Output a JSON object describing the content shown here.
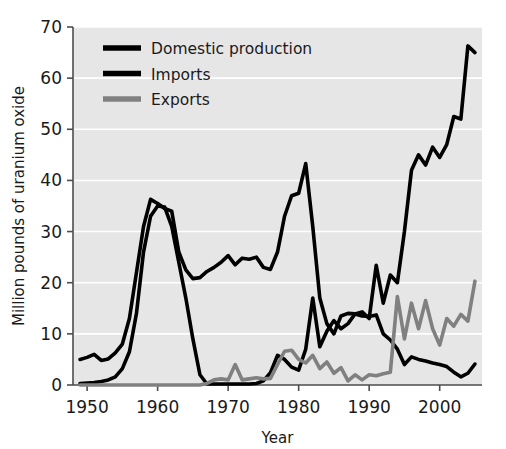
{
  "chart_data": {
    "type": "line",
    "title": "",
    "xlabel": "Year",
    "ylabel": "Million pounds of uranium oxide",
    "xlim": [
      1948,
      2006
    ],
    "ylim": [
      0,
      70
    ],
    "yticks": [
      0,
      10,
      20,
      30,
      40,
      50,
      60,
      70
    ],
    "xticks": [
      1950,
      1960,
      1970,
      1980,
      1990,
      2000
    ],
    "grid": "horizontal-white-gridlines",
    "legend_position": "top-left-inside",
    "plot_background": "#e6e6e6",
    "x": [
      1949,
      1950,
      1951,
      1952,
      1953,
      1954,
      1955,
      1956,
      1957,
      1958,
      1959,
      1960,
      1961,
      1962,
      1963,
      1964,
      1965,
      1966,
      1967,
      1968,
      1969,
      1970,
      1971,
      1972,
      1973,
      1974,
      1975,
      1976,
      1977,
      1978,
      1979,
      1980,
      1981,
      1982,
      1983,
      1984,
      1985,
      1986,
      1987,
      1988,
      1989,
      1990,
      1991,
      1992,
      1993,
      1994,
      1995,
      1996,
      1997,
      1998,
      1999,
      2000,
      2001,
      2002,
      2003,
      2004,
      2005
    ],
    "series": [
      {
        "name": "Domestic production",
        "color": "#000000",
        "values": [
          5.0,
          5.4,
          6.0,
          4.8,
          5.1,
          6.3,
          8.0,
          13.0,
          22.0,
          31.0,
          36.3,
          35.5,
          34.5,
          34.0,
          26.0,
          22.5,
          20.8,
          21.0,
          22.2,
          23.0,
          24.0,
          25.3,
          23.5,
          24.8,
          24.6,
          25.0,
          23.0,
          22.6,
          26.0,
          33.0,
          37.0,
          37.5,
          43.3,
          31.0,
          17.0,
          12.0,
          10.0,
          13.5,
          14.0,
          13.9,
          13.5,
          13.4,
          13.7,
          10.0,
          8.8,
          7.0,
          4.0,
          5.5,
          5.0,
          4.7,
          4.3,
          4.0,
          3.6,
          2.5,
          1.6,
          2.3,
          4.1
        ]
      },
      {
        "name": "Imports",
        "color": "#000000",
        "values": [
          0.3,
          0.4,
          0.5,
          0.7,
          1.0,
          1.6,
          3.2,
          6.5,
          14.0,
          26.0,
          33.0,
          35.0,
          34.8,
          31.0,
          24.0,
          17.0,
          9.0,
          2.0,
          0.2,
          0.2,
          0.2,
          0.2,
          0.2,
          0.2,
          0.2,
          0.3,
          0.8,
          2.4,
          5.8,
          5.0,
          3.5,
          2.9,
          7.0,
          17.0,
          7.5,
          10.5,
          12.6,
          11.0,
          12.0,
          13.9,
          14.3,
          13.0,
          23.4,
          16.0,
          21.5,
          20.0,
          30.0,
          42.0,
          45.0,
          43.0,
          46.5,
          44.5,
          47.0,
          52.5,
          52.0,
          66.3,
          65.0
        ]
      },
      {
        "name": "Exports",
        "color": "#808080",
        "values": [
          0.0,
          0.0,
          0.0,
          0.0,
          0.0,
          0.0,
          0.0,
          0.0,
          0.0,
          0.0,
          0.0,
          0.0,
          0.0,
          0.0,
          0.0,
          0.0,
          0.0,
          0.0,
          0.3,
          1.0,
          1.2,
          1.0,
          4.0,
          1.0,
          1.2,
          1.4,
          1.2,
          1.3,
          4.0,
          6.6,
          6.8,
          5.0,
          4.3,
          5.8,
          3.2,
          4.5,
          2.3,
          3.4,
          0.8,
          2.0,
          1.0,
          2.0,
          1.8,
          2.2,
          2.5,
          17.3,
          9.0,
          16.0,
          11.0,
          16.5,
          11.0,
          7.8,
          13.0,
          11.5,
          13.8,
          12.5,
          20.3
        ]
      }
    ]
  },
  "legend": {
    "entries": [
      {
        "label": "Domestic production",
        "color": "#000000"
      },
      {
        "label": "Imports",
        "color": "#000000"
      },
      {
        "label": "Exports",
        "color": "#808080"
      }
    ]
  },
  "axes": {
    "x_title": "Year",
    "y_title": "Million pounds of uranium oxide",
    "x_tick_labels": [
      "1950",
      "1960",
      "1970",
      "1980",
      "1990",
      "2000"
    ],
    "y_tick_labels": [
      "0",
      "10",
      "20",
      "30",
      "40",
      "50",
      "60",
      "70"
    ]
  }
}
